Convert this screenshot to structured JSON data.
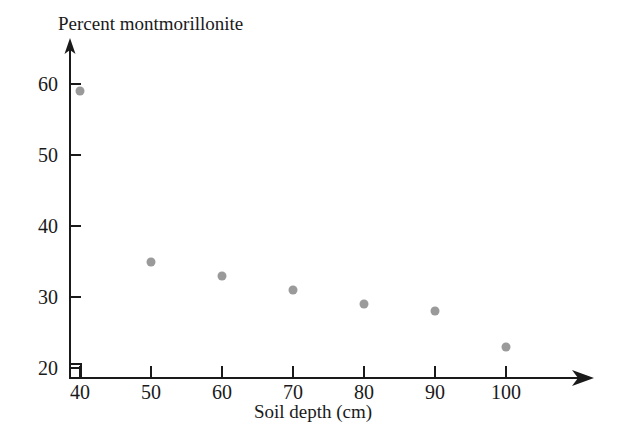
{
  "chart_data": {
    "type": "scatter",
    "title": "Percent montmorillonite",
    "xlabel": "Soil depth (cm)",
    "ylabel": "Percent montmorillonite",
    "x": [
      40,
      50,
      60,
      70,
      80,
      90,
      100
    ],
    "values": [
      59,
      35,
      33,
      31,
      29,
      28,
      23
    ],
    "points": [
      {
        "x": 40,
        "y": 59
      },
      {
        "x": 50,
        "y": 35
      },
      {
        "x": 60,
        "y": 33
      },
      {
        "x": 70,
        "y": 31
      },
      {
        "x": 80,
        "y": 29
      },
      {
        "x": 90,
        "y": 28
      },
      {
        "x": 100,
        "y": 23
      }
    ],
    "xticks": [
      "40",
      "50",
      "60",
      "70",
      "80",
      "90",
      "100"
    ],
    "yticks": [
      "20",
      "30",
      "40",
      "50",
      "60"
    ],
    "xlim": [
      40,
      100
    ],
    "ylim": [
      20,
      60
    ],
    "grid": false,
    "legend": false,
    "marker_color": "#9a9a9a",
    "axis_color": "#1a1a1a",
    "background_color": "#ffffff",
    "axis_break": true
  },
  "axes": {
    "y_title": "Percent montmorillonite",
    "x_title": "Soil depth (cm)"
  }
}
